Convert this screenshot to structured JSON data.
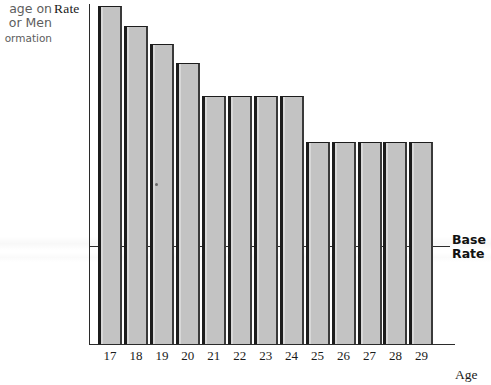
{
  "caption": {
    "line1": "age on",
    "line2": "or Men",
    "line3": "ormation"
  },
  "labels": {
    "y_axis": "Rate",
    "x_axis": "Age",
    "base_rate_line1": "Base",
    "base_rate_line2": "Rate"
  },
  "colors": {
    "bar_fill": "#c3c3c3",
    "bar_edge": "#1c1c1c",
    "axis": "#2b2b2b",
    "background": "#ffffff",
    "caption_text": "#5d5d5d"
  },
  "chart_data": {
    "type": "bar",
    "title": "",
    "subtitle": "",
    "xlabel": "Age",
    "ylabel": "Rate",
    "categories": [
      "17",
      "18",
      "19",
      "20",
      "21",
      "22",
      "23",
      "24",
      "25",
      "26",
      "27",
      "28",
      "29"
    ],
    "values": [
      1.78,
      1.64,
      1.51,
      1.37,
      1.14,
      1.14,
      1.14,
      1.14,
      0.81,
      0.81,
      0.81,
      0.81,
      0.81
    ],
    "value_unit": "relative rate (Base Rate = 1.0)",
    "pixel_tops": [
      6,
      26,
      44,
      63,
      96,
      96,
      96,
      96,
      142,
      142,
      142,
      142,
      142
    ],
    "baseline_pixel_y": 344,
    "reference_lines": [
      {
        "label": "Base Rate",
        "value": 1.0,
        "pixel_y": 246,
        "style": "solid",
        "label_position": "right"
      }
    ],
    "ylim": [
      0,
      2.0
    ],
    "yticks": [],
    "ytick_labels": [],
    "grid": false,
    "legend": false,
    "legend_position": "none",
    "annotations": [
      {
        "text": "age on",
        "position": "top-left",
        "clipped": true
      },
      {
        "text": "or Men",
        "position": "top-left",
        "clipped": true
      },
      {
        "text": "ormation",
        "position": "top-left",
        "clipped": true
      }
    ]
  }
}
